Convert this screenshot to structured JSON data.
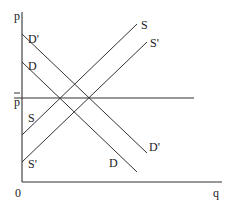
{
  "diagram": {
    "type": "supply-demand",
    "axes": {
      "y_label": "p",
      "x_label": "q",
      "origin_label": "0"
    },
    "price_line": {
      "label": "p̄",
      "label_text": "p"
    },
    "curves": [
      {
        "id": "D_prime",
        "label": "D'",
        "kind": "demand",
        "from": [
          22,
          34
        ],
        "to": [
          147,
          153
        ]
      },
      {
        "id": "D",
        "label": "D",
        "kind": "demand",
        "from": [
          22,
          62
        ],
        "to": [
          137,
          172
        ]
      },
      {
        "id": "S",
        "label": "S",
        "kind": "supply",
        "from": [
          22,
          135
        ],
        "to": [
          137,
          24
        ]
      },
      {
        "id": "S_prime",
        "label": "S'",
        "kind": "supply",
        "from": [
          22,
          162
        ],
        "to": [
          147,
          42
        ]
      }
    ],
    "labels": {
      "d_prime_top": "D'",
      "d_top": "D",
      "s_left": "S",
      "s_prime_left": "S'",
      "s_right": "S",
      "s_prime_right": "S'",
      "d_prime_right": "D'",
      "d_bottom": "D"
    }
  }
}
